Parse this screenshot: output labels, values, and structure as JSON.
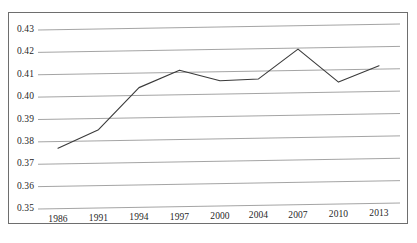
{
  "chart_data": {
    "type": "line",
    "title": "",
    "xlabel": "",
    "ylabel": "",
    "categories": [
      "1986",
      "1991",
      "1994",
      "1997",
      "2000",
      "2004",
      "2007",
      "2010",
      "2013"
    ],
    "values": [
      0.377,
      0.385,
      0.4035,
      0.411,
      0.406,
      0.4065,
      0.4195,
      0.4045,
      0.4115
    ],
    "series": [
      {
        "name": "",
        "values": [
          0.377,
          0.385,
          0.4035,
          0.411,
          0.406,
          0.4065,
          0.4195,
          0.4045,
          0.4115
        ]
      }
    ],
    "ylim": [
      0.35,
      0.43
    ],
    "yticks": [
      "0.35",
      "0.36",
      "0.37",
      "0.38",
      "0.39",
      "0.40",
      "0.41",
      "0.42",
      "0.43"
    ],
    "ytick_values": [
      0.35,
      0.36,
      0.37,
      0.38,
      0.39,
      0.4,
      0.41,
      0.42,
      0.43
    ],
    "xticks": [
      "1986",
      "1991",
      "1994",
      "1997",
      "2000",
      "2004",
      "2007",
      "2010",
      "2013"
    ],
    "grid": true,
    "grid_axis": "y",
    "legend": false,
    "legend_position": "none",
    "annotations": [],
    "colors": {
      "line": "#3a3a3a",
      "grid": "#9a9a9a",
      "frame": "#6e6e6e",
      "background": "#ffffff",
      "text": "#1f1f1f"
    }
  }
}
